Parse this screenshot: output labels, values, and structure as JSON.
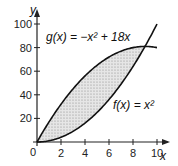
{
  "chart_data": {
    "type": "line",
    "title": "",
    "xlabel": "x",
    "ylabel": "y",
    "xlim": [
      0,
      10
    ],
    "ylim": [
      0,
      100
    ],
    "x_ticks": [
      "0",
      "2",
      "4",
      "6",
      "8",
      "10"
    ],
    "y_ticks": [
      "20",
      "40",
      "60",
      "80",
      "100"
    ],
    "series": [
      {
        "name": "g(x) = −x² + 18x",
        "x": [
          0,
          1,
          2,
          3,
          4,
          5,
          6,
          7,
          8,
          9,
          10
        ],
        "values": [
          0,
          17,
          32,
          45,
          56,
          65,
          72,
          77,
          80,
          81,
          80
        ]
      },
      {
        "name": "f(x) = x²",
        "x": [
          0,
          1,
          2,
          3,
          4,
          5,
          6,
          7,
          8,
          9,
          10
        ],
        "values": [
          0,
          1,
          4,
          9,
          16,
          25,
          36,
          49,
          64,
          81,
          100
        ]
      }
    ],
    "annotations": [
      {
        "text": "g(x) = −x² + 18x",
        "position": "top"
      },
      {
        "text": "f(x) = x²",
        "position": "right"
      },
      {
        "text": "shaded region between curves from x=0 to x=9"
      }
    ],
    "grid": false,
    "legend": "none"
  },
  "labels": {
    "g": "g(x) = −x² + 18x",
    "f": "f(x) = x²",
    "x_axis": "x",
    "y_axis": "y"
  }
}
